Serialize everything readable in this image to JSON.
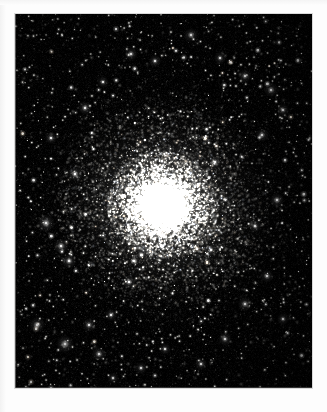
{
  "document": {
    "kind": "astronomical-photograph",
    "background_color": "#fdfdfd",
    "width": 327,
    "height": 412,
    "caption": ""
  },
  "photo": {
    "label": "globular-cluster",
    "frame": {
      "x": 15,
      "y": 14,
      "width": 297,
      "height": 374
    },
    "sky_color": "#000000",
    "border_color": "#d9d9d9",
    "seam_color": "#969696"
  },
  "sky": {
    "seed": 20240517,
    "background_levels": {
      "base": "#000000",
      "noise_max": 14,
      "corner_falloff": 0.55
    },
    "cluster": {
      "name": "globular-cluster-core",
      "center_x": 148,
      "center_y": 191,
      "core_radius": 16,
      "halo_radius": 56,
      "outer_radius": 132,
      "core_star_count": 5200,
      "halo_star_count": 4200,
      "outer_star_count": 2600,
      "core_glow_color": "#ffffff",
      "halo_glow_color": "#e8e8e4",
      "star_color": "#fffdf6",
      "ellipticity": 0.95,
      "position_angle_deg": 18
    },
    "field": {
      "name": "foreground-star-field",
      "star_count": 1350,
      "faint_star_count": 2600,
      "bright_star_count": 120,
      "star_color": "#fffefa",
      "max_radius": 2.2
    },
    "bright_stars": [
      {
        "x": 31,
        "y": 209,
        "r": 1.9,
        "b": 0.94
      },
      {
        "x": 46,
        "y": 232,
        "r": 1.7,
        "b": 0.88
      },
      {
        "x": 54,
        "y": 247,
        "r": 1.6,
        "b": 0.85
      },
      {
        "x": 22,
        "y": 311,
        "r": 1.8,
        "b": 0.9
      },
      {
        "x": 50,
        "y": 330,
        "r": 2.0,
        "b": 0.96
      },
      {
        "x": 74,
        "y": 311,
        "r": 1.5,
        "b": 0.82
      },
      {
        "x": 84,
        "y": 340,
        "r": 1.6,
        "b": 0.86
      },
      {
        "x": 96,
        "y": 301,
        "r": 1.4,
        "b": 0.8
      },
      {
        "x": 114,
        "y": 268,
        "r": 1.5,
        "b": 0.84
      },
      {
        "x": 60,
        "y": 160,
        "r": 1.6,
        "b": 0.86
      },
      {
        "x": 36,
        "y": 124,
        "r": 1.4,
        "b": 0.79
      },
      {
        "x": 70,
        "y": 94,
        "r": 1.5,
        "b": 0.83
      },
      {
        "x": 88,
        "y": 68,
        "r": 1.3,
        "b": 0.76
      },
      {
        "x": 116,
        "y": 40,
        "r": 1.5,
        "b": 0.84
      },
      {
        "x": 140,
        "y": 47,
        "r": 1.4,
        "b": 0.8
      },
      {
        "x": 176,
        "y": 21,
        "r": 1.6,
        "b": 0.88
      },
      {
        "x": 205,
        "y": 44,
        "r": 1.4,
        "b": 0.79
      },
      {
        "x": 230,
        "y": 62,
        "r": 1.5,
        "b": 0.83
      },
      {
        "x": 256,
        "y": 76,
        "r": 1.6,
        "b": 0.87
      },
      {
        "x": 268,
        "y": 96,
        "r": 1.4,
        "b": 0.8
      },
      {
        "x": 247,
        "y": 121,
        "r": 1.5,
        "b": 0.84
      },
      {
        "x": 262,
        "y": 186,
        "r": 1.6,
        "b": 0.86
      },
      {
        "x": 240,
        "y": 212,
        "r": 1.4,
        "b": 0.8
      },
      {
        "x": 252,
        "y": 262,
        "r": 1.5,
        "b": 0.83
      },
      {
        "x": 230,
        "y": 290,
        "r": 1.6,
        "b": 0.87
      },
      {
        "x": 268,
        "y": 305,
        "r": 1.4,
        "b": 0.79
      },
      {
        "x": 210,
        "y": 325,
        "r": 1.5,
        "b": 0.82
      },
      {
        "x": 186,
        "y": 350,
        "r": 1.4,
        "b": 0.78
      },
      {
        "x": 150,
        "y": 335,
        "r": 1.3,
        "b": 0.76
      },
      {
        "x": 126,
        "y": 354,
        "r": 1.4,
        "b": 0.79
      },
      {
        "x": 98,
        "y": 364,
        "r": 1.3,
        "b": 0.74
      },
      {
        "x": 200,
        "y": 148,
        "r": 1.4,
        "b": 0.8
      },
      {
        "x": 196,
        "y": 236,
        "r": 1.3,
        "b": 0.76
      },
      {
        "x": 112,
        "y": 196,
        "r": 1.3,
        "b": 0.77
      }
    ]
  }
}
